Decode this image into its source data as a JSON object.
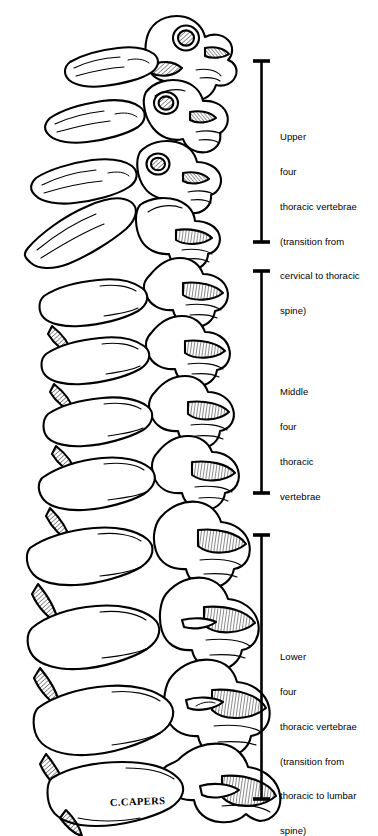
{
  "figure": {
    "view": "lateral",
    "line_color": "#000000",
    "background_color": "#ffffff",
    "vertebra_count": 12,
    "signature": "C.CAPERS"
  },
  "brackets": [
    {
      "name": "upper-bracket",
      "top": 60,
      "bottom": 243,
      "cap_left": 253,
      "cap_right": 270,
      "stem_x": 261.5
    },
    {
      "name": "middle-bracket",
      "top": 270,
      "bottom": 494,
      "cap_left": 253,
      "cap_right": 270,
      "stem_x": 261.5
    },
    {
      "name": "lower-bracket",
      "top": 534,
      "bottom": 800,
      "cap_left": 253,
      "cap_right": 270,
      "stem_x": 261.5
    }
  ],
  "labels": {
    "upper": {
      "id": "upper",
      "lines": [
        "Upper",
        "four",
        "thoracic vertebrae",
        "(transition from",
        "cervical to thoracic",
        "spine)"
      ],
      "line1": "Upper",
      "line2": "four",
      "line3": "thoracic vertebrae",
      "line4": "(transition from",
      "line5": "cervical to thoracic",
      "line6": "spine)"
    },
    "middle": {
      "id": "middle",
      "lines": [
        "Middle",
        "four",
        "thoracic",
        "vertebrae"
      ],
      "line1": "Middle",
      "line2": "four",
      "line3": "thoracic",
      "line4": "vertebrae"
    },
    "lower": {
      "id": "lower",
      "lines": [
        "Lower",
        "four",
        "thoracic vertebrae",
        "(transition from",
        "thoracic to lumbar",
        "spine)"
      ],
      "line1": "Lower",
      "line2": "four",
      "line3": "thoracic vertebrae",
      "line4": "(transition from",
      "line5": "thoracic to lumbar",
      "line6": "spine)"
    }
  },
  "signature": {
    "text": "C.CAPERS",
    "x": 110,
    "y": 806
  }
}
